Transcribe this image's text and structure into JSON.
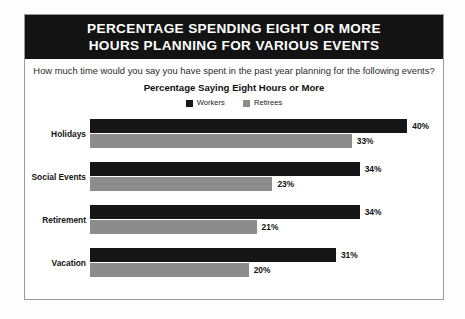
{
  "title": {
    "line1": "PERCENTAGE SPENDING EIGHT OR MORE",
    "line2": "HOURS PLANNING FOR VARIOUS EVENTS"
  },
  "question": "How much time would you say you have spent in the past year planning for the following events?",
  "subtitle": "Percentage Saying Eight Hours or More",
  "legend": {
    "workers": "Workers",
    "retirees": "Retirees"
  },
  "rows": [
    {
      "category": "Holidays",
      "workers_label": "40%",
      "retirees_label": "33%"
    },
    {
      "category": "Social Events",
      "workers_label": "34%",
      "retirees_label": "23%"
    },
    {
      "category": "Retirement",
      "workers_label": "34%",
      "retirees_label": "21%"
    },
    {
      "category": "Vacation",
      "workers_label": "31%",
      "retirees_label": "20%"
    }
  ],
  "chart_data": {
    "type": "bar",
    "orientation": "horizontal",
    "title": "PERCENTAGE SPENDING EIGHT OR MORE HOURS PLANNING FOR VARIOUS EVENTS",
    "subtitle": "Percentage Saying Eight Hours or More",
    "annotation": "How much time would you say you have spent in the past year planning for the following events?",
    "categories": [
      "Holidays",
      "Social Events",
      "Retirement",
      "Vacation"
    ],
    "series": [
      {
        "name": "Workers",
        "values": [
          40,
          34,
          34,
          31
        ],
        "color": "#161616"
      },
      {
        "name": "Retirees",
        "values": [
          33,
          23,
          21,
          20
        ],
        "color": "#8c8c8c"
      }
    ],
    "value_suffix": "%",
    "xlabel": "",
    "ylabel": "",
    "xlim": [
      0,
      44
    ],
    "grid": false,
    "legend_position": "top-center"
  },
  "colors": {
    "banner_background": "#131313",
    "banner_text": "#ffffff",
    "workers_bar": "#161616",
    "retirees_bar": "#8c8c8c",
    "frame_border": "#9a9a9a",
    "page_background": "#ffffff"
  }
}
